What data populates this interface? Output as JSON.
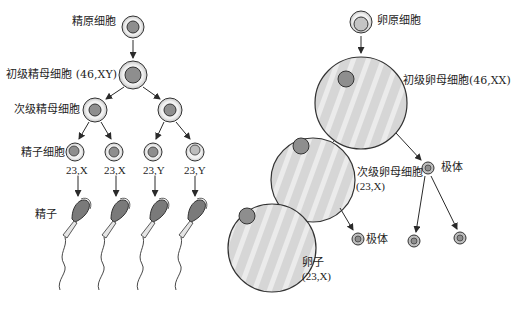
{
  "diagram": {
    "type": "meiosis-gametogenesis-comparison",
    "colors": {
      "outline": "#333333",
      "cell_fill": "#d4d4d4",
      "cell_ring": "#efefef",
      "nucleus_fill": "#8e8e8e",
      "sperm_head": "#7a7a7a",
      "large_cell_fill": "#d9d9d9",
      "stripe": "#eeeeee",
      "arrow": "#2a2a2a"
    }
  },
  "spermatogenesis": {
    "spermatogonium": {
      "label": "精原细胞"
    },
    "primary_spermatocyte": {
      "label": "初级精母细胞 (46,XY)"
    },
    "secondary_spermatocyte": {
      "label": "次级精母细胞"
    },
    "spermatid": {
      "label": "精子细胞",
      "karyotypes": [
        "23,X",
        "23,X",
        "23,Y",
        "23,Y"
      ]
    },
    "sperm": {
      "label": "精子"
    }
  },
  "oogenesis": {
    "oogonium": {
      "label": "卵原细胞"
    },
    "primary_oocyte": {
      "label": "初级卵母细胞(46,XX)"
    },
    "secondary_oocyte": {
      "label": "次级卵母细胞",
      "karyotype": "(23,X)"
    },
    "first_polar_body": {
      "label": "极体"
    },
    "second_polar_body": {
      "label": "极体"
    },
    "ovum": {
      "label": "卵子",
      "karyotype": "(23,X)"
    }
  }
}
